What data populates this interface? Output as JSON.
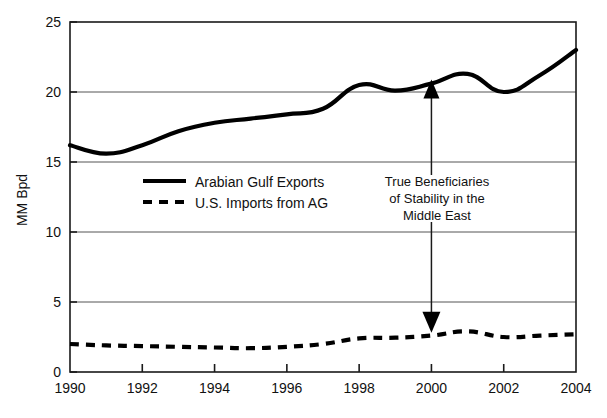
{
  "chart_data": {
    "type": "line",
    "title": "",
    "xlabel": "",
    "ylabel": "MM Bpd",
    "xlim": [
      1990,
      2004
    ],
    "ylim": [
      0,
      25
    ],
    "grid": true,
    "legend_position": "inside-left",
    "x": [
      1990,
      1991,
      1992,
      1993,
      1994,
      1995,
      1996,
      1997,
      1998,
      1999,
      2000,
      2001,
      2002,
      2003,
      2004
    ],
    "xtick_labels": [
      "1990",
      "1992",
      "1994",
      "1996",
      "1998",
      "2000",
      "2002",
      "2004"
    ],
    "xtick_values": [
      1990,
      1992,
      1994,
      1996,
      1998,
      2000,
      2002,
      2004
    ],
    "ytick_labels": [
      "0",
      "5",
      "10",
      "15",
      "20",
      "25"
    ],
    "ytick_values": [
      0,
      5,
      10,
      15,
      20,
      25
    ],
    "series": [
      {
        "name": "Arabian Gulf Exports",
        "style": "solid",
        "color": "#000000",
        "values": [
          16.2,
          15.6,
          16.2,
          17.2,
          17.8,
          18.1,
          18.4,
          18.8,
          20.5,
          20.1,
          20.6,
          21.3,
          20.0,
          21.2,
          23.0
        ]
      },
      {
        "name": "U.S. Imports from AG",
        "style": "dashed",
        "color": "#000000",
        "values": [
          2.0,
          1.9,
          1.85,
          1.8,
          1.75,
          1.7,
          1.8,
          2.0,
          2.4,
          2.45,
          2.6,
          2.9,
          2.5,
          2.6,
          2.7
        ]
      }
    ],
    "annotations": [
      {
        "name": "true-beneficiaries-note",
        "lines": [
          "True Beneficiaries",
          "of Stability in the",
          "Middle East"
        ],
        "arrow": "double-headed-vertical",
        "at_x": 2000,
        "top_value": 20.9,
        "bottom_value": 2.8
      }
    ]
  },
  "legend": {
    "items": [
      {
        "label": "Arabian Gulf Exports",
        "style": "solid"
      },
      {
        "label": "U.S. Imports from AG",
        "style": "dashed"
      }
    ]
  },
  "axes": {
    "y_title": "MM Bpd"
  }
}
